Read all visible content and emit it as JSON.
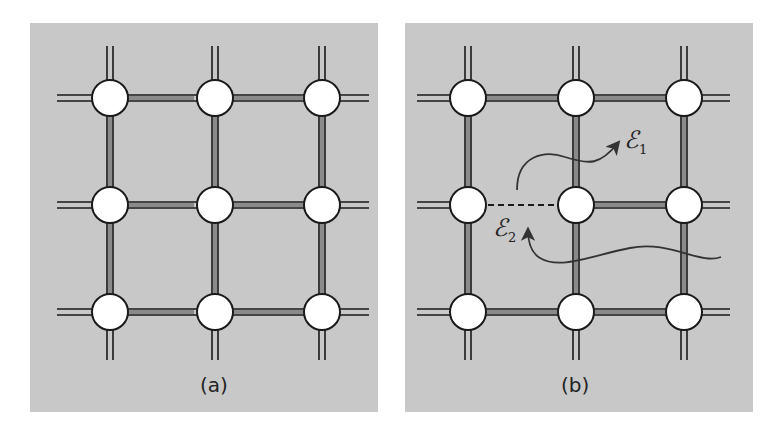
{
  "figure": {
    "panels": [
      {
        "id": "a",
        "caption": "(a)",
        "description": "Intact square lattice, 3x3 nodes, all bonds present"
      },
      {
        "id": "b",
        "caption": "(b)",
        "description": "Lattice with broken bond (dashed) between left and center nodes of middle row"
      }
    ],
    "annotations": {
      "epsilon1": {
        "symbol": "ℰ",
        "subscript": "1"
      },
      "epsilon2": {
        "symbol": "ℰ",
        "subscript": "2"
      }
    },
    "colors": {
      "background": "#c8c8c8",
      "node_fill": "#ffffff",
      "line": "#1a1a1a",
      "bond_fill": "#888888"
    }
  }
}
